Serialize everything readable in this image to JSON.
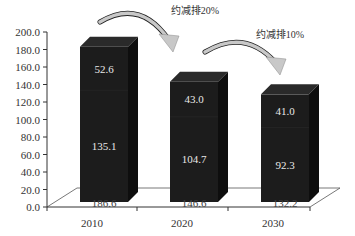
{
  "chart_data": {
    "type": "bar",
    "stacked": true,
    "style": "3d-column",
    "title": "",
    "xlabel": "",
    "ylabel": "",
    "categories": [
      "2010",
      "2020",
      "2030"
    ],
    "series": [
      {
        "name": "bottom",
        "values": [
          135.1,
          104.7,
          92.3
        ]
      },
      {
        "name": "top",
        "values": [
          52.6,
          43.0,
          41.0
        ]
      }
    ],
    "totals": [
      186.6,
      146.6,
      132.2
    ],
    "ylim": [
      0,
      200
    ],
    "yticks": [
      "0.0",
      "20.0",
      "40.0",
      "60.0",
      "80.0",
      "100.0",
      "120.0",
      "140.0",
      "160.0",
      "180.0",
      "200.0"
    ],
    "annotations": [
      {
        "text": "约减排20%",
        "from": "2010",
        "to": "2020"
      },
      {
        "text": "约减排10%",
        "from": "2020",
        "to": "2030"
      }
    ],
    "grid": false,
    "legend": "none"
  },
  "colors": {
    "bar_front": "#1c1c1c",
    "bar_side": "#0e0e0e",
    "bar_top": "#2a2a2a",
    "arrow": "#c8c8c8",
    "axis": "#333333"
  }
}
